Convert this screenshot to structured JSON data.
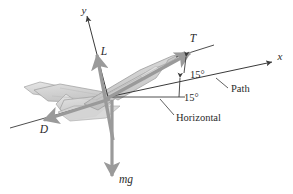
{
  "figure": {
    "background_color": "#ffffff",
    "axes": {
      "y_label": "y",
      "x_label": "x"
    },
    "forces": [
      {
        "id": "lift",
        "label": "L",
        "color": "#9a9a9a",
        "direction": "up-left-tilted"
      },
      {
        "id": "thrust",
        "label": "T",
        "color": "#9a9a9a",
        "direction": "up-right-along-fuselage"
      },
      {
        "id": "drag",
        "label": "D",
        "color": "#9a9a9a",
        "direction": "down-left-rearward"
      },
      {
        "id": "weight",
        "label": "mg",
        "color": "#9a9a9a",
        "direction": "straight-down"
      }
    ],
    "angles": [
      {
        "id": "angle-of-attack",
        "value": "15°",
        "between": "thrust-axis and path"
      },
      {
        "id": "flight-path-angle",
        "value": "15°",
        "between": "path and horizontal"
      }
    ],
    "reference_lines": [
      {
        "id": "path-line",
        "label": "Path",
        "color": "#3a3a3a"
      },
      {
        "id": "horizontal-line",
        "label": "Horizontal",
        "color": "#3a3a3a"
      }
    ],
    "aircraft": {
      "name": "fighter-jet",
      "fill_color": "#d0d0d0",
      "stroke_color": "#9b9b9b"
    }
  }
}
